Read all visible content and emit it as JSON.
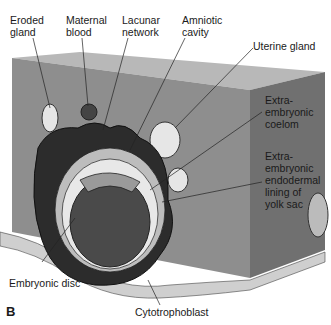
{
  "figure": {
    "panel_letter": "B",
    "labels": {
      "eroded_gland": "Eroded\ngland",
      "maternal_blood": "Maternal\nblood",
      "lacunar_network": "Lacunar\nnetwork",
      "amniotic_cavity": "Amniotic\ncavity",
      "uterine_gland": "Uterine gland",
      "extraembryonic_coelom": "Extra-\nembryonic\ncoelom",
      "extraembryonic_endoderm": "Extra-\nembryonic\nendodermal\nlining of\nyolk sac",
      "embryonic_disc": "Embryonic disc",
      "cytotrophoblast": "Cytotrophoblast"
    },
    "colors": {
      "block_front": "#8c8c8c",
      "block_top": "#b3b3b3",
      "block_side": "#6e6e6e",
      "trophoblast": "#2a2a2a",
      "cavity": "#4a4a4a",
      "gland": "#e0e0e0"
    }
  }
}
